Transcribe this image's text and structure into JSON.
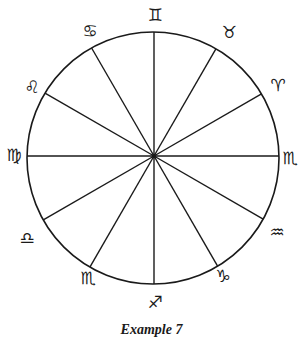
{
  "diagram": {
    "type": "zodiac-wheel",
    "divisions": 12,
    "line_color": "#1a1a1a",
    "circle": {
      "cx": 153,
      "cy": 158,
      "r": 126
    },
    "hub": {
      "x": 154,
      "y": 156
    },
    "signs": [
      {
        "name": "gemini",
        "glyph": "♊",
        "x": 155,
        "y": 15
      },
      {
        "name": "taurus",
        "glyph": "♉",
        "x": 229,
        "y": 32
      },
      {
        "name": "aries",
        "glyph": "♈",
        "x": 278,
        "y": 85
      },
      {
        "name": "scorpio-right",
        "glyph": "♏",
        "x": 290,
        "y": 158
      },
      {
        "name": "aquarius",
        "glyph": "♒",
        "x": 277,
        "y": 232
      },
      {
        "name": "capricorn",
        "glyph": "♑",
        "x": 223,
        "y": 276
      },
      {
        "name": "sagittarius",
        "glyph": "♐",
        "x": 155,
        "y": 302
      },
      {
        "name": "scorpio-left",
        "glyph": "♏",
        "x": 88,
        "y": 278
      },
      {
        "name": "libra",
        "glyph": "♎",
        "x": 27,
        "y": 238
      },
      {
        "name": "virgo",
        "glyph": "♍",
        "x": 14,
        "y": 155
      },
      {
        "name": "leo",
        "glyph": "♌",
        "x": 32,
        "y": 87
      },
      {
        "name": "cancer",
        "glyph": "♋",
        "x": 90,
        "y": 31
      }
    ]
  },
  "caption": "Example 7"
}
